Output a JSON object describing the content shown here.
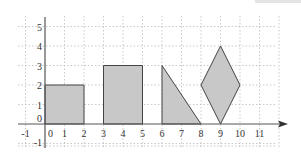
{
  "diagram": {
    "title": "",
    "x_ticks": [
      "-1",
      "0",
      "1",
      "2",
      "3",
      "4",
      "5",
      "6",
      "7",
      "8",
      "9",
      "10",
      "11"
    ],
    "y_ticks": [
      "5",
      "4",
      "3",
      "2",
      "1",
      "0",
      "-1"
    ],
    "fill_color": "#c8c8c8",
    "stroke_color": "#444444",
    "grid_color": "#bbbbbb",
    "shapes": [
      {
        "name": "rectangle-1",
        "type": "rectangle",
        "points": [
          [
            0,
            0
          ],
          [
            2,
            0
          ],
          [
            2,
            2
          ],
          [
            0,
            2
          ]
        ]
      },
      {
        "name": "rectangle-2",
        "type": "rectangle",
        "points": [
          [
            3,
            0
          ],
          [
            5,
            0
          ],
          [
            5,
            3
          ],
          [
            3,
            3
          ]
        ]
      },
      {
        "name": "right-triangle",
        "type": "triangle",
        "points": [
          [
            6,
            0
          ],
          [
            6,
            3
          ],
          [
            8,
            0
          ]
        ]
      },
      {
        "name": "rhombus",
        "type": "rhombus",
        "points": [
          [
            9,
            0
          ],
          [
            10,
            2
          ],
          [
            9,
            4
          ],
          [
            8,
            2
          ]
        ]
      }
    ]
  }
}
